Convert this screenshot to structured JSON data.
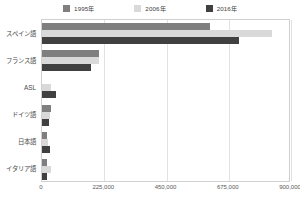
{
  "chart_data": {
    "type": "bar",
    "orientation": "horizontal",
    "title": "",
    "subtitle": "",
    "xlabel": "",
    "ylabel": "",
    "categories": [
      "スペイン語",
      "フランス語",
      "ASL",
      "ドイツ語",
      "日本語",
      "イタリア語"
    ],
    "series": [
      {
        "name": "1995年",
        "color": "#7f7f7f",
        "values": [
          606000,
          206000,
          0,
          33000,
          19000,
          17000
        ]
      },
      {
        "name": "2006年",
        "color": "#d9d9d9",
        "values": [
          831000,
          206000,
          33000,
          30000,
          23000,
          31000
        ]
      },
      {
        "name": "2016年",
        "color": "#404040",
        "values": [
          713000,
          176000,
          50000,
          26000,
          29000,
          19000
        ]
      }
    ],
    "xlim": [
      0,
      900000
    ],
    "xticks": [
      0,
      225000,
      450000,
      675000,
      900000
    ],
    "xticklabels": [
      "0",
      "225,000",
      "450,000",
      "675,000",
      "900,000"
    ],
    "grid": true,
    "grid_axis": "x",
    "legend_position": "top"
  },
  "legend": {
    "items": [
      {
        "label": "1995年",
        "color": "#7f7f7f"
      },
      {
        "label": "2006年",
        "color": "#d9d9d9"
      },
      {
        "label": "2016年",
        "color": "#404040"
      }
    ]
  },
  "axis": {
    "x_ticklabels": [
      "0",
      "225,000",
      "450,000",
      "675,000",
      "900,000"
    ],
    "y_categories": [
      "スペイン語",
      "フランス語",
      "ASL",
      "ドイツ語",
      "日本語",
      "イタリア語"
    ]
  },
  "colors": {
    "series_1995": "#7f7f7f",
    "series_2006": "#d9d9d9",
    "series_2016": "#404040",
    "gridline": "#e2e2e2",
    "frame": "#d0d0d0",
    "text": "#4a4a4a",
    "background": "#ffffff"
  }
}
